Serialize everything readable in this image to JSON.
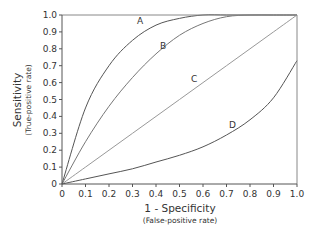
{
  "chart_data": {
    "type": "line",
    "title": "",
    "xlabel": "1 - Specificity",
    "xlabel_sub": "(False-positive rate)",
    "ylabel": "Sensitivity",
    "ylabel_sub": "(True-positive rate)",
    "xlim": [
      0,
      1.0
    ],
    "ylim": [
      0,
      1.0
    ],
    "grid": false,
    "legend": "none (curves labelled inline A, B, C, D)",
    "x_ticks": [
      "0",
      "0.1",
      "0.2",
      "0.3",
      "0.4",
      "0.5",
      "0.6",
      "0.7",
      "0.8",
      "0.9",
      "1.0"
    ],
    "y_ticks": [
      "0",
      "0.1",
      "0.2",
      "0.3",
      "0.4",
      "0.5",
      "0.6",
      "0.7",
      "0.8",
      "0.9",
      "1.0"
    ],
    "x": [
      0,
      0.1,
      0.2,
      0.3,
      0.4,
      0.5,
      0.6,
      0.7,
      0.8,
      0.9,
      1.0
    ],
    "series": [
      {
        "name": "A",
        "values": [
          0,
          0.45,
          0.7,
          0.85,
          0.94,
          0.98,
          1.0,
          1.0,
          1.0,
          1.0,
          1.0
        ]
      },
      {
        "name": "B",
        "values": [
          0,
          0.25,
          0.46,
          0.63,
          0.77,
          0.88,
          0.95,
          0.99,
          1.0,
          1.0,
          1.0
        ]
      },
      {
        "name": "C",
        "values": [
          0,
          0.1,
          0.2,
          0.3,
          0.4,
          0.5,
          0.6,
          0.7,
          0.8,
          0.9,
          1.0
        ]
      },
      {
        "name": "D",
        "values": [
          0,
          0.03,
          0.06,
          0.09,
          0.13,
          0.17,
          0.22,
          0.29,
          0.38,
          0.51,
          0.73
        ]
      }
    ]
  },
  "labels": {
    "A": "A",
    "B": "B",
    "C": "C",
    "D": "D"
  }
}
